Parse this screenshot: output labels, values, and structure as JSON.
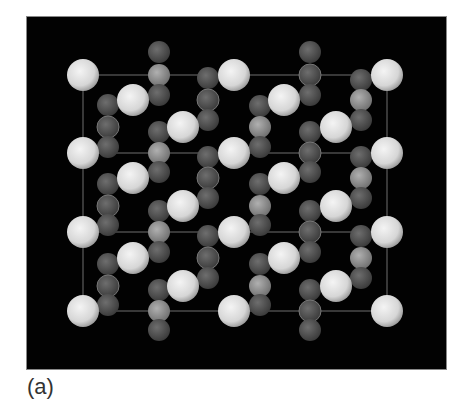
{
  "figure": {
    "panel_label": "(a)",
    "background": "#020202",
    "colors": {
      "large_atom": "#e6e6e6",
      "small_atom": "#5a5a5a",
      "small_atom_light": "#9a9a9a",
      "cell_line": "#8a8a8a"
    },
    "cell_lines": {
      "x": [
        83,
        234,
        387
      ],
      "y": [
        75,
        153,
        232,
        311
      ]
    },
    "large_atoms": [
      [
        83,
        75
      ],
      [
        234,
        75
      ],
      [
        387,
        75
      ],
      [
        83,
        153
      ],
      [
        234,
        153
      ],
      [
        387,
        153
      ],
      [
        83,
        232
      ],
      [
        234,
        232
      ],
      [
        387,
        232
      ],
      [
        83,
        311
      ],
      [
        234,
        311
      ],
      [
        387,
        311
      ],
      [
        133,
        100
      ],
      [
        183,
        127
      ],
      [
        133,
        178
      ],
      [
        183,
        206
      ],
      [
        133,
        258
      ],
      [
        183,
        286
      ],
      [
        284,
        100
      ],
      [
        336,
        127
      ],
      [
        284,
        178
      ],
      [
        336,
        206
      ],
      [
        284,
        258
      ],
      [
        336,
        286
      ]
    ],
    "small_atoms": [
      [
        159,
        52,
        "d"
      ],
      [
        159,
        75,
        "l"
      ],
      [
        159,
        95,
        "d"
      ],
      [
        159,
        132,
        "d"
      ],
      [
        159,
        153,
        "l"
      ],
      [
        159,
        172,
        "d"
      ],
      [
        159,
        211,
        "d"
      ],
      [
        159,
        232,
        "l"
      ],
      [
        159,
        252,
        "d"
      ],
      [
        159,
        290,
        "d"
      ],
      [
        159,
        311,
        "l"
      ],
      [
        159,
        330,
        "d"
      ],
      [
        208,
        78,
        "d"
      ],
      [
        208,
        100,
        "r"
      ],
      [
        208,
        120,
        "d"
      ],
      [
        208,
        157,
        "d"
      ],
      [
        208,
        178,
        "r"
      ],
      [
        208,
        198,
        "d"
      ],
      [
        208,
        236,
        "d"
      ],
      [
        208,
        258,
        "r"
      ],
      [
        208,
        278,
        "d"
      ],
      [
        108,
        105,
        "d"
      ],
      [
        108,
        127,
        "r"
      ],
      [
        108,
        147,
        "d"
      ],
      [
        108,
        184,
        "d"
      ],
      [
        108,
        206,
        "r"
      ],
      [
        108,
        225,
        "d"
      ],
      [
        108,
        264,
        "d"
      ],
      [
        108,
        286,
        "r"
      ],
      [
        108,
        305,
        "d"
      ],
      [
        310,
        52,
        "d"
      ],
      [
        310,
        75,
        "r"
      ],
      [
        310,
        95,
        "d"
      ],
      [
        310,
        132,
        "d"
      ],
      [
        310,
        153,
        "r"
      ],
      [
        310,
        172,
        "d"
      ],
      [
        310,
        211,
        "d"
      ],
      [
        310,
        232,
        "r"
      ],
      [
        310,
        252,
        "d"
      ],
      [
        310,
        290,
        "d"
      ],
      [
        310,
        311,
        "r"
      ],
      [
        310,
        330,
        "d"
      ],
      [
        260,
        106,
        "d"
      ],
      [
        260,
        127,
        "l"
      ],
      [
        260,
        147,
        "d"
      ],
      [
        260,
        184,
        "d"
      ],
      [
        260,
        206,
        "l"
      ],
      [
        260,
        225,
        "d"
      ],
      [
        260,
        264,
        "d"
      ],
      [
        260,
        286,
        "l"
      ],
      [
        260,
        305,
        "d"
      ],
      [
        361,
        80,
        "d"
      ],
      [
        361,
        100,
        "l"
      ],
      [
        361,
        120,
        "d"
      ],
      [
        361,
        157,
        "d"
      ],
      [
        361,
        178,
        "l"
      ],
      [
        361,
        198,
        "d"
      ],
      [
        361,
        236,
        "d"
      ],
      [
        361,
        258,
        "l"
      ],
      [
        361,
        278,
        "d"
      ]
    ]
  }
}
